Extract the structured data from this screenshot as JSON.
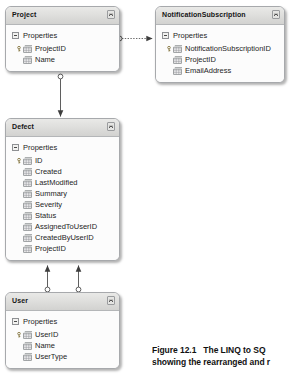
{
  "diagram": {
    "entities": [
      {
        "id": "project",
        "name": "Project",
        "group_label": "Properties",
        "collapse_icon": "collapse-chevron-icon",
        "properties": [
          {
            "name": "ProjectID",
            "is_key": true,
            "icon": "property-icon"
          },
          {
            "name": "Name",
            "is_key": false,
            "icon": "property-icon"
          }
        ]
      },
      {
        "id": "notificationsubscription",
        "name": "NotificationSubscription",
        "group_label": "Properties",
        "collapse_icon": "collapse-chevron-icon",
        "properties": [
          {
            "name": "NotificationSubscriptionID",
            "is_key": true,
            "icon": "property-icon"
          },
          {
            "name": "ProjectID",
            "is_key": false,
            "icon": "property-icon"
          },
          {
            "name": "EmailAddress",
            "is_key": false,
            "icon": "property-icon"
          }
        ]
      },
      {
        "id": "defect",
        "name": "Defect",
        "group_label": "Properties",
        "collapse_icon": "collapse-chevron-icon",
        "properties": [
          {
            "name": "ID",
            "is_key": true,
            "icon": "property-icon"
          },
          {
            "name": "Created",
            "is_key": false,
            "icon": "property-icon"
          },
          {
            "name": "LastModified",
            "is_key": false,
            "icon": "property-icon"
          },
          {
            "name": "Summary",
            "is_key": false,
            "icon": "property-icon"
          },
          {
            "name": "Severity",
            "is_key": false,
            "icon": "property-icon"
          },
          {
            "name": "Status",
            "is_key": false,
            "icon": "property-icon"
          },
          {
            "name": "AssignedToUserID",
            "is_key": false,
            "icon": "property-icon"
          },
          {
            "name": "CreatedByUserID",
            "is_key": false,
            "icon": "property-icon"
          },
          {
            "name": "ProjectID",
            "is_key": false,
            "icon": "property-icon"
          }
        ]
      },
      {
        "id": "user",
        "name": "User",
        "group_label": "Properties",
        "collapse_icon": "collapse-chevron-icon",
        "properties": [
          {
            "name": "UserID",
            "is_key": true,
            "icon": "property-icon"
          },
          {
            "name": "Name",
            "is_key": false,
            "icon": "property-icon"
          },
          {
            "name": "UserType",
            "is_key": false,
            "icon": "property-icon"
          }
        ]
      }
    ],
    "associations": [
      {
        "from": "project",
        "to": "notificationsubscription",
        "style": "dotted",
        "source_marker": "circle",
        "target_marker": "arrow"
      },
      {
        "from": "project",
        "to": "defect",
        "style": "solid",
        "source_marker": "circle",
        "target_marker": "arrow"
      },
      {
        "from": "user",
        "to": "defect",
        "style": "solid",
        "source_marker": "circle",
        "target_marker": "arrow"
      },
      {
        "from": "user",
        "to": "defect",
        "style": "solid",
        "source_marker": "circle",
        "target_marker": "arrow"
      }
    ]
  },
  "caption": {
    "figure_number": "Figure 12.1",
    "line1_text": "The LINQ to SQ",
    "line2_text": "showing the rearranged and r"
  },
  "colors": {
    "header_top": "#e9e9e7",
    "header_bottom": "#d2d2d0",
    "border": "#a7a9ac",
    "body": "#fcfcfc",
    "connector": "#4d4d4d",
    "text": "#1e1e1e",
    "property_icon": "#6f7276"
  }
}
